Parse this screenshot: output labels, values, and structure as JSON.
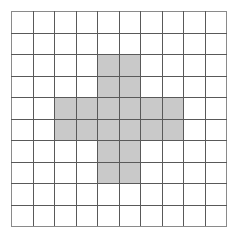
{
  "figure": {
    "grid": {
      "rows": 10,
      "columns": 10,
      "cell_size_px": 21.5,
      "line_color": "#595959",
      "background_color": "#ffffff",
      "shaded_color": "#c9c9c9",
      "shaded_cell_count": 20,
      "total_cell_count": 100
    },
    "chart_data": {
      "type": "heatmap",
      "title": "Shaded cross pattern on a square grid",
      "xlabel": "",
      "ylabel": "",
      "categories": [
        "1",
        "2",
        "3",
        "4",
        "5",
        "6",
        "7",
        "8",
        "9",
        "10"
      ],
      "row_labels": [
        "1",
        "2",
        "3",
        "4",
        "5",
        "6",
        "7",
        "8",
        "9",
        "10"
      ],
      "legend": [],
      "grid": true,
      "values": [
        [
          0,
          0,
          0,
          0,
          0,
          0,
          0,
          0,
          0,
          0
        ],
        [
          0,
          0,
          0,
          0,
          0,
          0,
          0,
          0,
          0,
          0
        ],
        [
          0,
          0,
          0,
          0,
          1,
          1,
          0,
          0,
          0,
          0
        ],
        [
          0,
          0,
          0,
          0,
          1,
          1,
          0,
          0,
          0,
          0
        ],
        [
          0,
          0,
          1,
          1,
          1,
          1,
          1,
          1,
          0,
          0
        ],
        [
          0,
          0,
          1,
          1,
          1,
          1,
          1,
          1,
          0,
          0
        ],
        [
          0,
          0,
          0,
          0,
          1,
          1,
          0,
          0,
          0,
          0
        ],
        [
          0,
          0,
          0,
          0,
          1,
          1,
          0,
          0,
          0,
          0
        ],
        [
          0,
          0,
          0,
          0,
          0,
          0,
          0,
          0,
          0,
          0
        ],
        [
          0,
          0,
          0,
          0,
          0,
          0,
          0,
          0,
          0,
          0
        ]
      ]
    }
  }
}
